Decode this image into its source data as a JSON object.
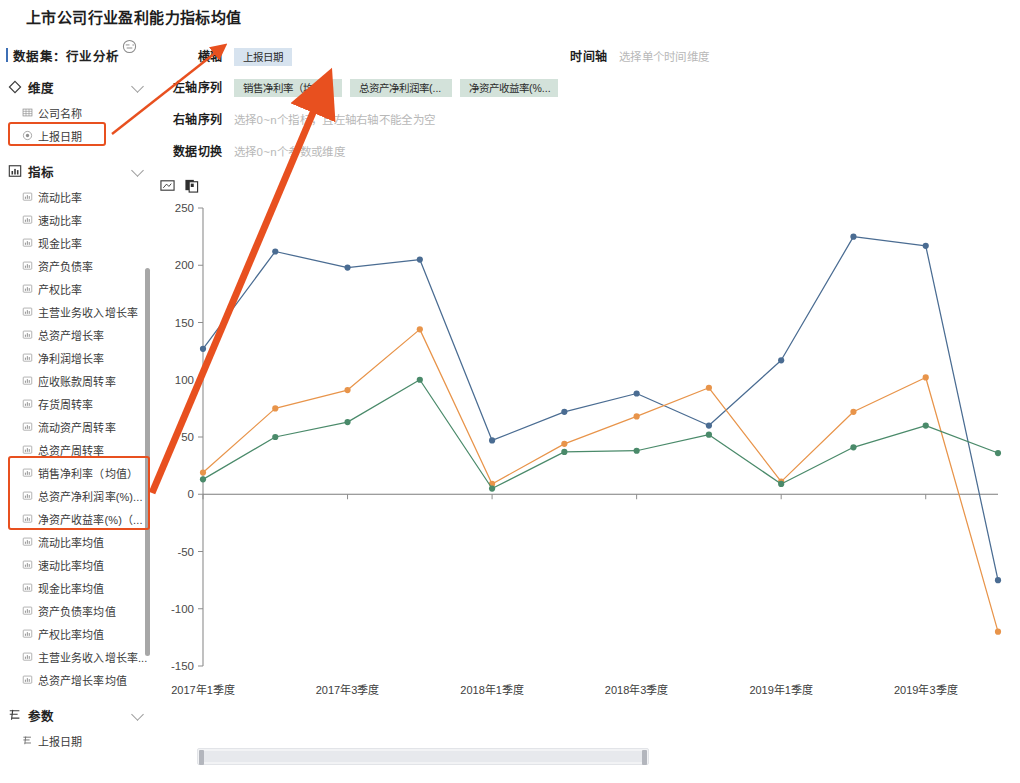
{
  "page": {
    "title": "上市公司行业盈利能力指标均值"
  },
  "sidebar": {
    "dataset": {
      "label": "数据集：行业分析",
      "refresh_icon": "refresh-icon"
    },
    "sections": [
      {
        "key": "dimension",
        "icon": "diamond-icon",
        "label": "维度",
        "expanded": true,
        "items": [
          {
            "label": "公司名称",
            "icon": "table-icon",
            "highlighted": false
          },
          {
            "label": "上报日期",
            "icon": "circle-dim-icon",
            "highlighted": true
          }
        ]
      },
      {
        "key": "metric",
        "icon": "bar-chart-icon",
        "label": "指标",
        "expanded": true,
        "items": [
          {
            "label": "流动比率",
            "icon": "metric-icon",
            "highlighted": false
          },
          {
            "label": "速动比率",
            "icon": "metric-icon",
            "highlighted": false
          },
          {
            "label": "现金比率",
            "icon": "metric-icon",
            "highlighted": false
          },
          {
            "label": "资产负债率",
            "icon": "metric-icon",
            "highlighted": false
          },
          {
            "label": "产权比率",
            "icon": "metric-icon",
            "highlighted": false
          },
          {
            "label": "主营业务收入增长率",
            "icon": "metric-icon",
            "highlighted": false
          },
          {
            "label": "总资产增长率",
            "icon": "metric-icon",
            "highlighted": false
          },
          {
            "label": "净利润增长率",
            "icon": "metric-icon",
            "highlighted": false
          },
          {
            "label": "应收账款周转率",
            "icon": "metric-icon",
            "highlighted": false
          },
          {
            "label": "存货周转率",
            "icon": "metric-icon",
            "highlighted": false
          },
          {
            "label": "流动资产周转率",
            "icon": "metric-icon",
            "highlighted": false
          },
          {
            "label": "总资产周转率",
            "icon": "metric-icon",
            "highlighted": false
          },
          {
            "label": "销售净利率（均值）",
            "icon": "metric-icon",
            "highlighted": true
          },
          {
            "label": "总资产净利润率(%)...",
            "icon": "metric-icon",
            "highlighted": true
          },
          {
            "label": "净资产收益率(%)（...",
            "icon": "metric-icon",
            "highlighted": true
          },
          {
            "label": "流动比率均值",
            "icon": "metric-icon",
            "highlighted": false
          },
          {
            "label": "速动比率均值",
            "icon": "metric-icon",
            "highlighted": false
          },
          {
            "label": "现金比率均值",
            "icon": "metric-icon",
            "highlighted": false
          },
          {
            "label": "资产负债率均值",
            "icon": "metric-icon",
            "highlighted": false
          },
          {
            "label": "产权比率均值",
            "icon": "metric-icon",
            "highlighted": false
          },
          {
            "label": "主营业务收入增长率...",
            "icon": "metric-icon",
            "highlighted": false
          },
          {
            "label": "总资产增长率均值",
            "icon": "metric-icon",
            "highlighted": false
          }
        ]
      },
      {
        "key": "param",
        "icon": "param-icon",
        "label": "参数",
        "expanded": true,
        "items": [
          {
            "label": "上报日期",
            "icon": "param-icon",
            "highlighted": false
          }
        ]
      }
    ]
  },
  "config": {
    "x_axis": {
      "label": "横轴",
      "tags": [
        "上报日期"
      ],
      "placeholder": ""
    },
    "left_series": {
      "label": "左轴序列",
      "tags": [
        "销售净利率（均...",
        "总资产净利润率(...",
        "净资产收益率(%..."
      ],
      "placeholder": ""
    },
    "right_series": {
      "label": "右轴序列",
      "tags": [],
      "placeholder": "选择0~n个指标，且左轴右轴不能全为空"
    },
    "data_switch": {
      "label": "数据切换",
      "tags": [],
      "placeholder": "选择0~n个参数或维度"
    },
    "time_axis": {
      "label": "时间轴",
      "tags": [],
      "placeholder": "选择单个时间维度"
    },
    "toolbar": {
      "icons": [
        "edit-image-icon",
        "copy-icon"
      ]
    }
  },
  "chart_data": {
    "type": "line",
    "title": "",
    "xlabel": "",
    "ylabel": "",
    "ylim": [
      -150,
      250
    ],
    "yticks": [
      250,
      200,
      150,
      100,
      50,
      0,
      -50,
      -100,
      -150
    ],
    "grid": false,
    "legend": "none",
    "x": [
      "2017年1季度",
      "2017年2季度",
      "2017年3季度",
      "2017年4季度",
      "2018年1季度",
      "2018年2季度",
      "2018年3季度",
      "2018年4季度",
      "2019年1季度",
      "2019年2季度",
      "2019年3季度",
      "2019年4季度"
    ],
    "xtick_labels": [
      "2017年1季度",
      "2017年3季度",
      "2018年1季度",
      "2018年3季度",
      "2019年1季度",
      "2019年3季度"
    ],
    "xtick_indices": [
      0,
      2,
      4,
      6,
      8,
      10
    ],
    "series": [
      {
        "name": "销售净利率（均值）",
        "color": "#4a6c92",
        "values": [
          127,
          212,
          198,
          205,
          47,
          72,
          88,
          60,
          117,
          225,
          217,
          -75
        ]
      },
      {
        "name": "总资产净利润率(%)",
        "color": "#e8944a",
        "values": [
          19,
          75,
          91,
          144,
          9,
          44,
          68,
          93,
          11,
          72,
          102,
          -120
        ]
      },
      {
        "name": "净资产收益率(%)",
        "color": "#4a8a6a",
        "values": [
          13,
          50,
          63,
          100,
          5,
          37,
          38,
          52,
          9,
          41,
          60,
          36
        ]
      }
    ]
  },
  "annotations": {
    "highlight_boxes": [
      {
        "name": "highlight-dimension-date",
        "x": 8,
        "y": 122,
        "w": 98,
        "h": 24
      },
      {
        "name": "highlight-metric-group",
        "x": 8,
        "y": 456,
        "w": 142,
        "h": 74
      }
    ],
    "arrows": [
      {
        "name": "arrow-to-x-axis",
        "from_x": 112,
        "from_y": 134,
        "to_x": 219,
        "to_y": 50
      },
      {
        "name": "arrow-to-left-series",
        "from_x": 152,
        "from_y": 493,
        "to_x": 320,
        "to_y": 96
      }
    ]
  },
  "scrollbars": {
    "sidebar_vertical": {
      "name": "sidebar-scrollbar"
    },
    "chart_horizontal": {
      "name": "chart-zoom-slider"
    }
  }
}
